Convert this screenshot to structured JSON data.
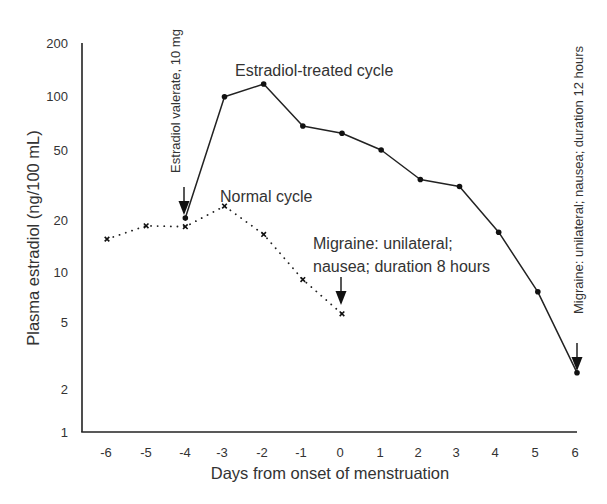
{
  "chart_data": {
    "type": "line",
    "title": "",
    "xlabel": "Days from onset of menstruation",
    "ylabel": "Plasma estradiol (ng/100 mL)",
    "yscale": "log",
    "ylim": [
      1,
      200
    ],
    "xlim": [
      -6,
      6
    ],
    "grid": false,
    "x_ticks": [
      "-6",
      "-5",
      "-4",
      "-3",
      "-2",
      "-1",
      "0",
      "1",
      "2",
      "3",
      "4",
      "5",
      "6"
    ],
    "y_ticks": [
      "200",
      "100",
      "50",
      "20",
      "10",
      "5",
      "2",
      "1"
    ],
    "x": [
      -6,
      -5,
      -4,
      -3,
      -2,
      -1,
      0,
      1,
      2,
      3,
      4,
      5,
      6
    ],
    "series": [
      {
        "name": "Estradiol-treated cycle",
        "style": "solid",
        "marker": "dot",
        "x": [
          -4,
          -3,
          -2,
          -1,
          0,
          1,
          2,
          3,
          4,
          5,
          6
        ],
        "values": [
          20.5,
          99,
          117,
          68,
          62,
          50,
          34,
          31,
          17,
          7.6,
          2.5
        ]
      },
      {
        "name": "Normal cycle",
        "style": "dotted",
        "marker": "x",
        "x": [
          -6,
          -5,
          -4,
          -3,
          -2,
          -1,
          0
        ],
        "values": [
          15.5,
          18.5,
          18.3,
          24,
          16.5,
          9,
          5.6
        ]
      }
    ],
    "annotations": [
      {
        "text": "Estradiol-treated cycle",
        "target": "series-0-label"
      },
      {
        "text": "Normal cycle",
        "target": "series-1-label"
      },
      {
        "text": "Estradiol valerate, 10 mg",
        "x": -4,
        "arrow": "down",
        "orientation": "vertical"
      },
      {
        "text_lines": [
          "Migraine: unilateral;",
          "nausea; duration 8 hours"
        ],
        "x": 0,
        "arrow": "down"
      },
      {
        "text": "Migraine: unilateral; nausea; duration 12 hours",
        "x": 6,
        "arrow": "down",
        "orientation": "vertical"
      }
    ]
  },
  "labels": {
    "xlabel": "Days from onset of menstruation",
    "ylabel": "Plasma estradiol (ng/100 mL)",
    "treated": "Estradiol-treated cycle",
    "normal": "Normal cycle",
    "dose": "Estradiol valerate, 10 mg",
    "migraine8_line1": "Migraine: unilateral;",
    "migraine8_line2": "nausea; duration 8 hours",
    "migraine12": "Migraine: unilateral; nausea; duration 12 hours"
  },
  "colors": {
    "line": "#222222",
    "text": "#333333",
    "background": "#ffffff"
  }
}
